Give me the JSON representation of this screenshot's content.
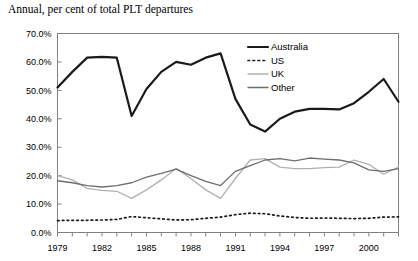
{
  "chart_data": {
    "type": "line",
    "title": "Annual, per cent of total PLT departures",
    "xlabel": "",
    "ylabel": "",
    "xlim": [
      1979,
      2002
    ],
    "ylim": [
      0,
      70
    ],
    "grid": false,
    "legend_position": "top-right",
    "y_tick_labels": [
      "0.0%",
      "10.0%",
      "20.0%",
      "30.0%",
      "40.0%",
      "50.0%",
      "60.0%",
      "70.0%"
    ],
    "y_ticks": [
      0,
      10,
      20,
      30,
      40,
      50,
      60,
      70
    ],
    "x_tick_labels": [
      "1979",
      "1982",
      "1985",
      "1988",
      "1991",
      "1994",
      "1997",
      "2000"
    ],
    "x_ticks": [
      1979,
      1982,
      1985,
      1988,
      1991,
      1994,
      1997,
      2000
    ],
    "x": [
      1979,
      1980,
      1981,
      1982,
      1983,
      1984,
      1985,
      1986,
      1987,
      1988,
      1989,
      1990,
      1991,
      1992,
      1993,
      1994,
      1995,
      1996,
      1997,
      1998,
      1999,
      2000,
      2001,
      2002
    ],
    "series": [
      {
        "name": "Australia",
        "color": "#1a1a1a",
        "width": 2.2,
        "style": "solid",
        "values": [
          51.0,
          56.5,
          61.5,
          61.8,
          61.5,
          41.0,
          50.5,
          56.5,
          60.0,
          59.0,
          61.5,
          63.0,
          47.0,
          38.0,
          35.5,
          40.0,
          42.5,
          43.5,
          43.5,
          43.3,
          45.5,
          49.5,
          54.0,
          46.0
        ]
      },
      {
        "name": "US",
        "color": "#1a1a1a",
        "width": 1.1,
        "style": "dotted",
        "values": [
          4.2,
          4.3,
          4.3,
          4.4,
          4.6,
          5.6,
          5.2,
          4.8,
          4.4,
          4.5,
          5.0,
          5.4,
          6.3,
          6.8,
          6.6,
          5.8,
          5.3,
          5.0,
          5.1,
          5.0,
          4.9,
          5.0,
          5.4,
          5.5
        ]
      },
      {
        "name": "UK",
        "color": "#b0b0b0",
        "width": 1.3,
        "style": "solid",
        "values": [
          20.0,
          18.5,
          15.5,
          14.8,
          14.5,
          12.0,
          15.0,
          18.5,
          22.5,
          19.0,
          15.0,
          12.0,
          19.0,
          25.5,
          26.0,
          23.0,
          22.5,
          22.5,
          22.8,
          23.0,
          25.5,
          24.0,
          20.5,
          23.0
        ]
      },
      {
        "name": "Other",
        "color": "#6e6e6e",
        "width": 1.3,
        "style": "solid",
        "values": [
          18.2,
          17.5,
          16.5,
          16.0,
          16.5,
          17.5,
          19.5,
          20.8,
          22.3,
          20.0,
          18.0,
          16.5,
          21.5,
          23.5,
          25.5,
          26.0,
          25.2,
          26.2,
          25.8,
          25.5,
          24.5,
          22.0,
          21.5,
          22.5
        ]
      }
    ]
  },
  "legend": {
    "items": [
      {
        "label": "Australia"
      },
      {
        "label": "US"
      },
      {
        "label": "UK"
      },
      {
        "label": "Other"
      }
    ]
  }
}
